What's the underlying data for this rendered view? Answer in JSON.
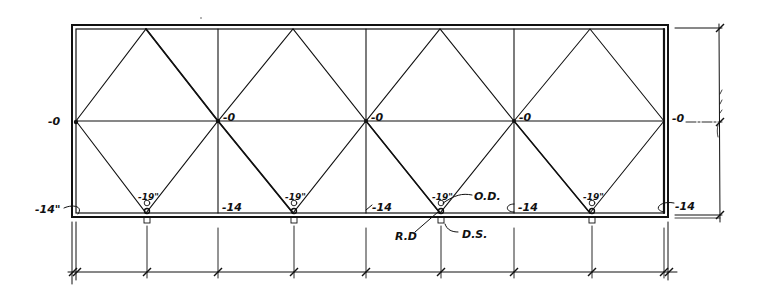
{
  "drawing": {
    "type": "roof drainage plan sketch",
    "stroke_color": "#111111",
    "background": "#ffffff"
  },
  "elevations": {
    "ridge_left": "-0",
    "ridge_1": "-0",
    "ridge_2": "-0",
    "ridge_3": "-0",
    "ridge_right": "-0",
    "edge_left": "-14\"",
    "edge_1": "-14",
    "edge_2": "-14",
    "edge_3": "-14",
    "edge_right": "-14",
    "drain_1": "-19\"",
    "drain_2": "-19\"",
    "drain_3": "-19\"",
    "drain_4": "-19\""
  },
  "callouts": {
    "overflow_drain": "O.D.",
    "roof_drain": "R.D",
    "downspout": "D.S."
  }
}
